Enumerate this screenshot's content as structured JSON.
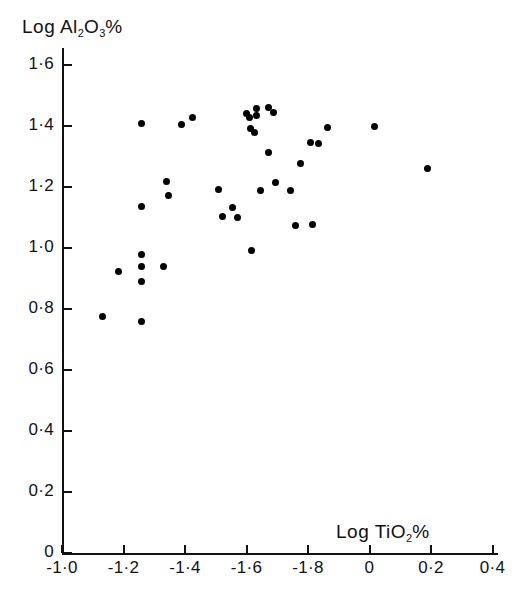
{
  "chart_data": {
    "type": "scatter",
    "title": "",
    "xlabel": "Log TiO2%",
    "ylabel": "Log Al2O3%",
    "xlabel_parts": {
      "prefix": "Log TiO",
      "sub": "2",
      "suffix": "%"
    },
    "ylabel_parts": {
      "prefix": "Log Al",
      "sub1": "2",
      "mid": "O",
      "sub2": "3",
      "suffix": "%"
    },
    "xticklabels": [
      "-1·0",
      "-1·2",
      "-1·4",
      "-1·6",
      "-1·8",
      "0",
      "0·2",
      "0·4"
    ],
    "xtickvalues": [
      -1.0,
      -1.2,
      -1.4,
      -1.6,
      -1.8,
      0,
      0.2,
      0.4
    ],
    "yticklabels": [
      "0",
      "0·2",
      "0·4",
      "0·6",
      "0·8",
      "1·0",
      "1·2",
      "1·4",
      "1·6"
    ],
    "ytickvalues": [
      0,
      0.2,
      0.4,
      0.6,
      0.8,
      1.0,
      1.2,
      1.4,
      1.6
    ],
    "ylim": [
      0,
      1.68
    ],
    "grid": false,
    "legend": null,
    "marker": "filled-circle",
    "marker_color": "#000000",
    "point_count": 38,
    "points_px": [
      [
        141,
        123
      ],
      [
        181,
        124
      ],
      [
        192,
        117
      ],
      [
        166,
        181
      ],
      [
        168,
        195
      ],
      [
        141,
        206
      ],
      [
        218,
        189
      ],
      [
        232,
        207
      ],
      [
        222,
        216
      ],
      [
        237,
        217
      ],
      [
        251,
        250
      ],
      [
        246,
        113
      ],
      [
        256,
        108
      ],
      [
        268,
        107
      ],
      [
        273,
        112
      ],
      [
        249,
        117
      ],
      [
        256,
        115
      ],
      [
        250,
        128
      ],
      [
        254,
        132
      ],
      [
        260,
        190
      ],
      [
        275,
        182
      ],
      [
        268,
        152
      ],
      [
        295,
        225
      ],
      [
        312,
        224
      ],
      [
        310,
        142
      ],
      [
        318,
        143
      ],
      [
        327,
        127
      ],
      [
        374,
        126
      ],
      [
        427,
        168
      ],
      [
        141,
        254
      ],
      [
        141,
        266
      ],
      [
        118,
        271
      ],
      [
        141,
        281
      ],
      [
        163,
        266
      ],
      [
        102,
        316
      ],
      [
        141,
        321
      ],
      [
        290,
        190
      ],
      [
        300,
        163
      ]
    ],
    "points_data": [
      {
        "x": -1.262,
        "y": 1.4098
      },
      {
        "x": -1.386,
        "y": 1.4066
      },
      {
        "x": -1.4201,
        "y": 1.4295
      },
      {
        "x": -1.3426,
        "y": 1.2197
      },
      {
        "x": -1.3488,
        "y": 1.1738
      },
      {
        "x": -1.265,
        "y": 1.1377
      },
      {
        "x": -1.4837,
        "y": 1.1934
      },
      {
        "x": -1.5271,
        "y": 1.1344
      },
      {
        "x": -1.4961,
        "y": 1.1049
      },
      {
        "x": -1.5426,
        "y": 1.1016
      },
      {
        "x": -1.586,
        "y": 0.9934
      },
      {
        "x": -1.7705,
        "y": 1.4426
      },
      {
        "x": -1.6016,
        "y": 1.459
      },
      {
        "x": -1.6388,
        "y": 1.4623
      },
      {
        "x": -1.6543,
        "y": 1.4459
      },
      {
        "x": -1.5798,
        "y": 1.4295
      },
      {
        "x": -1.6016,
        "y": 1.4361
      },
      {
        "x": -1.5829,
        "y": 1.3934
      },
      {
        "x": -1.5953,
        "y": 1.3803
      },
      {
        "x": -1.614,
        "y": 1.1902
      },
      {
        "x": -1.6605,
        "y": 1.2164
      },
      {
        "x": -1.6388,
        "y": 1.3148
      },
      {
        "x": -1.7224,
        "y": 1.0754
      },
      {
        "x": -1.7752,
        "y": 1.0787
      },
      {
        "x": -1.769,
        "y": 1.3475
      },
      {
        "x": -1.7938,
        "y": 1.3443
      },
      {
        "x": -1.8217,
        "y": 1.3967
      },
      {
        "x": 0.0174,
        "y": 1.3999
      },
      {
        "x": 0.1816,
        "y": 1.2623
      },
      {
        "x": -1.262,
        "y": 0.9803
      },
      {
        "x": -1.262,
        "y": 0.941
      },
      {
        "x": -1.1907,
        "y": 0.9246
      },
      {
        "x": -1.262,
        "y": 0.8918
      },
      {
        "x": -1.3302,
        "y": 0.941
      },
      {
        "x": -1.1411,
        "y": 0.7934
      },
      {
        "x": -1.262,
        "y": 0.777
      },
      {
        "x": -1.7069,
        "y": 1.1902
      },
      {
        "x": -1.7379,
        "y": 1.2787
      }
    ]
  },
  "axes": {
    "y_axis_name": "y-axis",
    "x_axis_name": "x-axis"
  }
}
